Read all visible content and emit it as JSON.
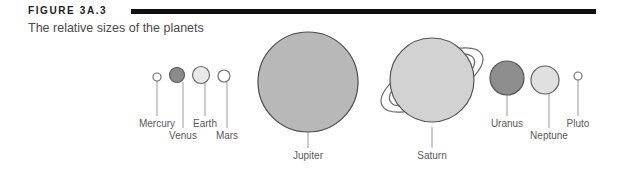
{
  "figure": {
    "number": "FIGURE 3A.3",
    "caption": "The relative sizes of the planets",
    "rule_color": "#111111"
  },
  "diagram": {
    "type": "scale-comparison",
    "subject": "relative sizes of the planets",
    "planets": [
      {
        "name": "Mercury",
        "cx": 157,
        "cy": 77,
        "r": 4.0,
        "fill": "#ffffff",
        "stroke": "#6e6e6e",
        "label_x": 157,
        "label_y": 118,
        "leader_from_y": 81,
        "leader_to_y": 116
      },
      {
        "name": "Venus",
        "cx": 177,
        "cy": 75,
        "r": 7.5,
        "fill": "#8a8a8a",
        "stroke": "#5a5a5a",
        "label_x": 183,
        "label_y": 130,
        "leader_from_y": 82,
        "leader_to_y": 128
      },
      {
        "name": "Earth",
        "cx": 201,
        "cy": 75,
        "r": 8.5,
        "fill": "#e9e9e9",
        "stroke": "#6e6e6e",
        "label_x": 205,
        "label_y": 118,
        "leader_from_y": 83,
        "leader_to_y": 116
      },
      {
        "name": "Mars",
        "cx": 224,
        "cy": 76,
        "r": 6.0,
        "fill": "#ffffff",
        "stroke": "#6e6e6e",
        "label_x": 227,
        "label_y": 130,
        "leader_from_y": 82,
        "leader_to_y": 128
      },
      {
        "name": "Jupiter",
        "cx": 308,
        "cy": 82,
        "r": 50,
        "fill": "#b8b8b8",
        "stroke": "#4a4a4a",
        "label_x": 308,
        "label_y": 150,
        "leader_from_y": 132,
        "leader_to_y": 148
      },
      {
        "name": "Saturn",
        "cx": 432,
        "cy": 80,
        "r": 42,
        "fill": "#d2d2d2",
        "stroke": "#555555",
        "label_x": 432,
        "label_y": 150,
        "leader_from_y": 127,
        "leader_to_y": 148,
        "has_rings": true,
        "ring_rotation_deg": -27,
        "ring_outer_rx": 56,
        "ring_outer_ry": 22,
        "ring_inner_rx": 47,
        "ring_inner_ry": 17
      },
      {
        "name": "Uranus",
        "cx": 507,
        "cy": 78,
        "r": 17,
        "fill": "#8e8e8e",
        "stroke": "#555555",
        "label_x": 507,
        "label_y": 118,
        "leader_from_y": 95,
        "leader_to_y": 116
      },
      {
        "name": "Neptune",
        "cx": 545,
        "cy": 80,
        "r": 14,
        "fill": "#e0e0e0",
        "stroke": "#5f5f5f",
        "label_x": 549,
        "label_y": 130,
        "leader_from_y": 94,
        "leader_to_y": 128
      },
      {
        "name": "Pluto",
        "cx": 578,
        "cy": 76,
        "r": 4.0,
        "fill": "#ffffff",
        "stroke": "#6e6e6e",
        "label_x": 578,
        "label_y": 118,
        "leader_from_y": 80,
        "leader_to_y": 116
      }
    ],
    "leader_line_color": "#9a9a9a",
    "label_color": "#5a5a5a"
  }
}
